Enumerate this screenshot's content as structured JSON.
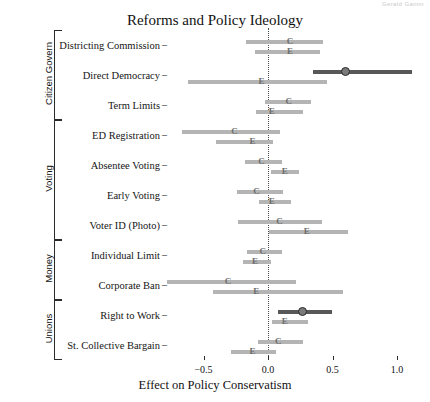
{
  "corner_stamp": "Gerald Gamm",
  "chart_data": {
    "type": "scatter",
    "title": "Reforms and Policy Ideology",
    "xlabel": "Effect on Policy Conservatism",
    "ylabel": "",
    "xlim": [
      -0.72,
      1.18
    ],
    "xticks": [
      -0.5,
      0.0,
      0.5,
      1.0
    ],
    "xticklabels": [
      "−0.5",
      "0.0",
      "0.5",
      "1.0"
    ],
    "grid": false,
    "zero_reference_line": 0.0,
    "legend": [],
    "series_markers": [
      "C",
      "E"
    ],
    "colors": {
      "light_interval": "#b4b4b4",
      "dark_interval": "#585858",
      "zero_line": "#4a4a4a",
      "axis": "#2b2b2b"
    },
    "groups": [
      {
        "name": "Citizen Govern",
        "categories": [
          "Districting Commission",
          "Direct Democracy",
          "Term Limits"
        ]
      },
      {
        "name": "Voting",
        "categories": [
          "ED Registration",
          "Absentee Voting",
          "Early Voting",
          "Voter ID (Photo)"
        ]
      },
      {
        "name": "Money",
        "categories": [
          "Individual Limit",
          "Corporate Ban"
        ]
      },
      {
        "name": "Unions",
        "categories": [
          "Right to Work",
          "St. Collective Bargain"
        ]
      }
    ],
    "rows": [
      {
        "label": "Districting Commission",
        "group": "Citizen Govern",
        "estimates": [
          {
            "marker": "C",
            "value": 0.17,
            "low": -0.17,
            "high": 0.43,
            "significant": false
          },
          {
            "marker": "E",
            "value": 0.17,
            "low": -0.1,
            "high": 0.4,
            "significant": false
          }
        ]
      },
      {
        "label": "Direct Democracy",
        "group": "Citizen Govern",
        "estimates": [
          {
            "marker": "C",
            "value": 0.61,
            "low": 0.35,
            "high": 1.12,
            "significant": true
          },
          {
            "marker": "E",
            "value": -0.05,
            "low": -0.62,
            "high": 0.46,
            "significant": false
          }
        ]
      },
      {
        "label": "Term Limits",
        "group": "Citizen Govern",
        "estimates": [
          {
            "marker": "C",
            "value": 0.16,
            "low": -0.02,
            "high": 0.33,
            "significant": false
          },
          {
            "marker": "E",
            "value": 0.03,
            "low": -0.09,
            "high": 0.27,
            "significant": false
          }
        ]
      },
      {
        "label": "ED Registration",
        "group": "Voting",
        "estimates": [
          {
            "marker": "C",
            "value": -0.26,
            "low": -0.67,
            "high": 0.09,
            "significant": false
          },
          {
            "marker": "E",
            "value": -0.12,
            "low": -0.4,
            "high": 0.04,
            "significant": false
          }
        ]
      },
      {
        "label": "Absentee Voting",
        "group": "Voting",
        "estimates": [
          {
            "marker": "C",
            "value": -0.05,
            "low": -0.18,
            "high": 0.11,
            "significant": false
          },
          {
            "marker": "E",
            "value": 0.13,
            "low": 0.02,
            "high": 0.24,
            "significant": false
          }
        ]
      },
      {
        "label": "Early Voting",
        "group": "Voting",
        "estimates": [
          {
            "marker": "C",
            "value": -0.09,
            "low": -0.24,
            "high": 0.12,
            "significant": false
          },
          {
            "marker": "E",
            "value": 0.03,
            "low": -0.07,
            "high": 0.18,
            "significant": false
          }
        ]
      },
      {
        "label": "Voter ID (Photo)",
        "group": "Voting",
        "estimates": [
          {
            "marker": "C",
            "value": 0.09,
            "low": -0.23,
            "high": 0.42,
            "significant": false
          },
          {
            "marker": "E",
            "value": 0.3,
            "low": 0.01,
            "high": 0.62,
            "significant": false
          }
        ]
      },
      {
        "label": "Individual Limit",
        "group": "Money",
        "estimates": [
          {
            "marker": "C",
            "value": -0.04,
            "low": -0.16,
            "high": 0.11,
            "significant": false
          },
          {
            "marker": "E",
            "value": -0.1,
            "low": -0.19,
            "high": 0.02,
            "significant": false
          }
        ]
      },
      {
        "label": "Corporate Ban",
        "group": "Money",
        "estimates": [
          {
            "marker": "C",
            "value": -0.31,
            "low": -0.78,
            "high": 0.22,
            "significant": false
          },
          {
            "marker": "E",
            "value": -0.09,
            "low": -0.43,
            "high": 0.58,
            "significant": false
          }
        ]
      },
      {
        "label": "Right to Work",
        "group": "Unions",
        "estimates": [
          {
            "marker": "C",
            "value": 0.27,
            "low": 0.08,
            "high": 0.5,
            "significant": true
          },
          {
            "marker": "E",
            "value": 0.13,
            "low": 0.03,
            "high": 0.31,
            "significant": false
          }
        ]
      },
      {
        "label": "St. Collective Bargain",
        "group": "Unions",
        "estimates": [
          {
            "marker": "C",
            "value": 0.08,
            "low": -0.08,
            "high": 0.27,
            "significant": false
          },
          {
            "marker": "E",
            "value": -0.12,
            "low": -0.29,
            "high": 0.06,
            "significant": false
          }
        ]
      }
    ]
  }
}
